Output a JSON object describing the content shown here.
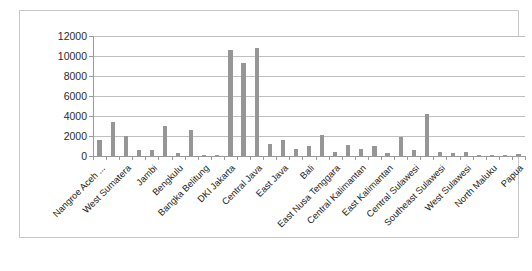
{
  "chart_data": {
    "type": "bar",
    "title": "",
    "subtitle": "",
    "xlabel": "",
    "ylabel": "",
    "ylim": [
      0,
      12000
    ],
    "ytick_step": 2000,
    "ytick_labels": [
      "12000",
      "10000",
      "8000",
      "6000",
      "4000",
      "2000",
      "0"
    ],
    "grid": true,
    "legend": false,
    "bar_color": "#969696",
    "gridline_color": "#bfbfbf",
    "axis_color": "#9a9a9a",
    "frame_border_color": "#c8c8c8",
    "categories": [
      "Nangroe Aceh ...",
      "North Sumatera",
      "West Sumatera",
      "Riau",
      "Jambi",
      "South Sumatera",
      "Bengkulu",
      "Lampung",
      "Bangka Belitung",
      "Riau Islands",
      "DKI Jakarta",
      "West Java",
      "Central Java",
      "DI Yogyakarta",
      "East Java",
      "Banten",
      "Bali",
      "West Nusa Tenggara",
      "East Nusa Tenggara",
      "West Kalimantan",
      "Central Kalimantan",
      "South Kalimantan",
      "East Kalimantan",
      "North Sulawesi",
      "Central Sulawesi",
      "South Sulawesi",
      "Southeast Sulawesi",
      "Gorontalo",
      "West Sulawesi",
      "Maluku",
      "North Maluku",
      "West Papua",
      "Papua"
    ],
    "visible_tick_labels": [
      "Nangroe Aceh ...",
      "West Sumatera",
      "Jambi",
      "Bengkulu",
      "Bangka Belitung",
      "DKI Jakarta",
      "Central Java",
      "East Java",
      "Bali",
      "East Nusa Tenggara",
      "Central Kalimantan",
      "East Kalimantan",
      "Central Sulawesi",
      "Southeast Sulawesi",
      "West Sulawesi",
      "North Maluku",
      "Papua"
    ],
    "values": [
      1600,
      3450,
      2000,
      620,
      640,
      3050,
      340,
      2650,
      120,
      110,
      10600,
      9300,
      10800,
      1250,
      1600,
      700,
      1000,
      2150,
      360,
      1100,
      680,
      1000,
      350,
      1900,
      650,
      4200,
      380,
      280,
      420,
      130,
      120,
      90,
      200
    ]
  }
}
